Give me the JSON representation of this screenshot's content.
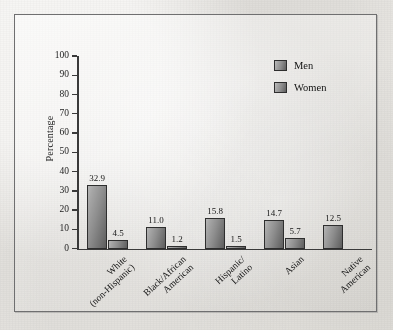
{
  "chart_data": {
    "type": "bar",
    "title": "",
    "xlabel": "",
    "ylabel": "Percentage",
    "ylim": [
      0,
      100
    ],
    "yticks": [
      0,
      10,
      20,
      30,
      40,
      50,
      60,
      70,
      80,
      90,
      100
    ],
    "grid": false,
    "legend_position": "top-right",
    "categories": [
      "White\n(non-Hispanic)",
      "Black/African\nAmerican",
      "Hispanic/\nLatino",
      "Asian",
      "Native\nAmerican"
    ],
    "series": [
      {
        "name": "Men",
        "values": [
          32.9,
          11.0,
          15.8,
          14.7,
          12.5
        ]
      },
      {
        "name": "Women",
        "values": [
          4.5,
          1.2,
          1.5,
          5.7,
          null
        ]
      }
    ],
    "data_labels": {
      "men": [
        "32.9",
        "11.0",
        "15.8",
        "14.7",
        "12.5"
      ],
      "women": [
        "4.5",
        "1.2",
        "1.5",
        "5.7",
        ""
      ]
    },
    "colors": {
      "bar_light": "#b7b7b7",
      "bar_dark": "#5d5d5d",
      "bar_border": "#2e2e2e",
      "axis": "#3a3a3a",
      "text": "#141414",
      "paper": "#e9e8e4",
      "frame": "#6f6f70"
    }
  },
  "legend": {
    "items": [
      {
        "label": "Men"
      },
      {
        "label": "Women"
      }
    ]
  },
  "axis": {
    "y_title": "Percentage",
    "tick_labels": [
      "100",
      "90",
      "80",
      "70",
      "60",
      "50",
      "40",
      "30",
      "20",
      "10",
      "0"
    ]
  }
}
